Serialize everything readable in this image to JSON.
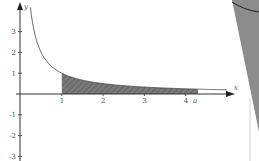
{
  "chart_data": {
    "type": "area",
    "title": "",
    "function": "y = 1/x",
    "xlabel": "x",
    "ylabel": "y",
    "xlim": [
      -0.5,
      5.2
    ],
    "ylim": [
      -3,
      4.5
    ],
    "x_ticks": [
      {
        "value": 1,
        "label": "1"
      },
      {
        "value": 2,
        "label": "2"
      },
      {
        "value": 3,
        "label": "3"
      },
      {
        "value": 4,
        "label": "4"
      }
    ],
    "y_ticks": [
      {
        "value": 3,
        "label": "3"
      },
      {
        "value": 2,
        "label": "2"
      },
      {
        "value": 1,
        "label": "1"
      },
      {
        "value": -1,
        "label": "-1"
      },
      {
        "value": -2,
        "label": "-2"
      },
      {
        "value": -3,
        "label": "-3"
      }
    ],
    "shaded_region": {
      "from": 1,
      "to": 4.3,
      "to_label": "a",
      "pattern": "hatched"
    },
    "curve_points": [
      {
        "x": 0.22,
        "y": 4.5
      },
      {
        "x": 0.3,
        "y": 3.33
      },
      {
        "x": 0.5,
        "y": 2.0
      },
      {
        "x": 0.75,
        "y": 1.33
      },
      {
        "x": 1,
        "y": 1.0
      },
      {
        "x": 1.5,
        "y": 0.67
      },
      {
        "x": 2,
        "y": 0.5
      },
      {
        "x": 3,
        "y": 0.33
      },
      {
        "x": 4,
        "y": 0.25
      },
      {
        "x": 4.3,
        "y": 0.23
      },
      {
        "x": 5.0,
        "y": 0.2
      }
    ],
    "grid": false,
    "legend": null
  },
  "labels": {
    "x_axis": "x",
    "y_axis": "y",
    "bound_a": "a"
  },
  "colors": {
    "axis": "#333333",
    "curve": "#444444",
    "shade": "#666666",
    "wedge": "#8c8c8c"
  }
}
